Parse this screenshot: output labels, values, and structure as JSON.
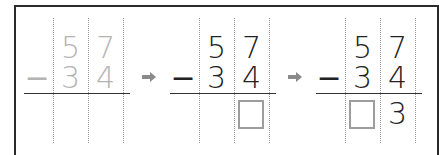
{
  "diagram": {
    "operator": "−",
    "steps": [
      {
        "state": "faded",
        "minuend": [
          "5",
          "7"
        ],
        "subtrahend": [
          "3",
          "4"
        ],
        "result": [
          "",
          ""
        ],
        "answer_boxes": []
      },
      {
        "state": "active",
        "minuend": [
          "5",
          "7"
        ],
        "subtrahend": [
          "3",
          "4"
        ],
        "result": [
          "",
          ""
        ],
        "answer_boxes": [
          "ones"
        ]
      },
      {
        "state": "active",
        "minuend": [
          "5",
          "7"
        ],
        "subtrahend": [
          "3",
          "4"
        ],
        "result": [
          "",
          "3"
        ],
        "answer_boxes": [
          "tens"
        ]
      }
    ],
    "arrow_icon": "right-arrow-icon",
    "colors": {
      "border": "#2b2b2b",
      "faded_digit": "#b4b4b4",
      "digit": "#222222",
      "dotted_guide": "#9a9a9a",
      "answer_box": "#9d9d9d",
      "arrow": "#8a8a8a"
    }
  }
}
